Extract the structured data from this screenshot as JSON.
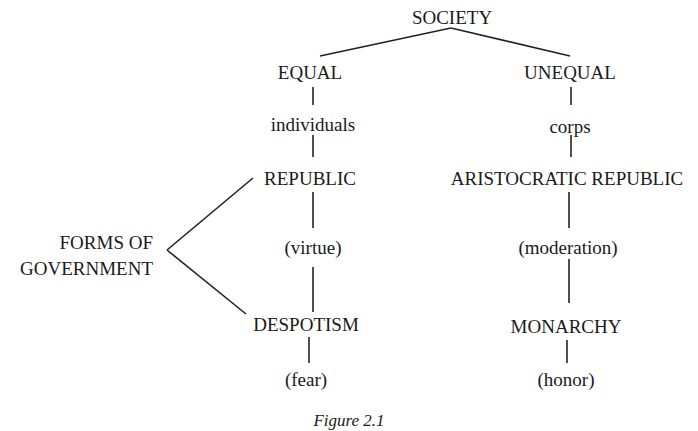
{
  "diagram": {
    "root": "SOCIETY",
    "branches": {
      "left": {
        "label": "EQUAL",
        "basis": "individuals",
        "government_1": "REPUBLIC",
        "principle_1": "(virtue)",
        "government_2": "DESPOTISM",
        "principle_2": "(fear)"
      },
      "right": {
        "label": "UNEQUAL",
        "basis": "corps",
        "government_1": "ARISTOCRATIC REPUBLIC",
        "principle_1": "(moderation)",
        "government_2": "MONARCHY",
        "principle_2": "(honor)"
      }
    },
    "side_label_line1": "FORMS OF",
    "side_label_line2": "GOVERNMENT",
    "caption": "Figure 2.1"
  }
}
